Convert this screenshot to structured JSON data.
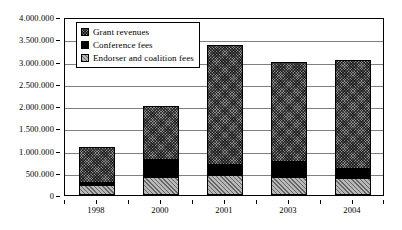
{
  "chart_data": {
    "type": "bar",
    "title": "",
    "subtitle": "",
    "xlabel": "",
    "ylabel": "",
    "stacked": true,
    "grid": true,
    "legend_position": "inside-top-left",
    "categories": [
      "1998",
      "2000",
      "2001",
      "2003",
      "2004"
    ],
    "ylim": [
      0,
      4000000
    ],
    "ytick_step": 500000,
    "ytick_labels": [
      "0",
      "500.000",
      "1.000.000",
      "1.500.000",
      "2.000.000",
      "2.500.000",
      "3.000.000",
      "3.500.000",
      "4.000.000"
    ],
    "ytick_values": [
      0,
      500000,
      1000000,
      1500000,
      2000000,
      2500000,
      3000000,
      3500000,
      4000000
    ],
    "series": [
      {
        "name": "Endorser and coalition fees",
        "pattern": "light-diagonal-hatch",
        "color": "#b8b8b8",
        "values": [
          230000,
          400000,
          460000,
          410000,
          390000
        ]
      },
      {
        "name": "Conference fees",
        "pattern": "solid-black",
        "color": "#000000",
        "values": [
          40000,
          380000,
          220000,
          330000,
          200000
        ]
      },
      {
        "name": "Grant revenues",
        "pattern": "dark-cross-hatch",
        "color": "#8a8a8a",
        "values": [
          800000,
          1210000,
          2700000,
          2240000,
          2450000
        ]
      }
    ],
    "totals": [
      1070000,
      1990000,
      3380000,
      2980000,
      3040000
    ]
  },
  "legend": {
    "entries": [
      {
        "label": "Grant revenues",
        "swatch": "dark-cross-hatch-swatch"
      },
      {
        "label": "Conference fees",
        "swatch": "solid-black-swatch"
      },
      {
        "label": "Endorser and coalition fees",
        "swatch": "light-diagonal-hatch-swatch"
      }
    ]
  }
}
